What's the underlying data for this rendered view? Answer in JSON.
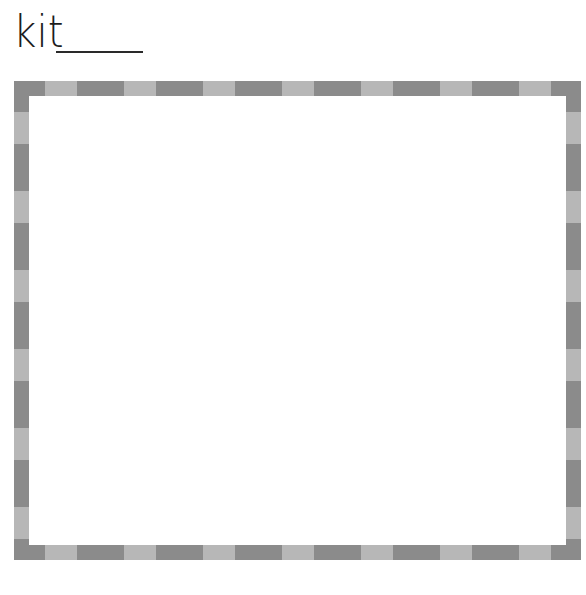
{
  "worksheet": {
    "word": "kit",
    "answer_blank": "",
    "drawing_box": {
      "border_style": "dashed-two-tone",
      "colors": {
        "dark": "#8b8b8b",
        "light": "#b7b7b7",
        "fill": "#ffffff"
      },
      "pattern": {
        "corner_length": 31,
        "dark_length": 47,
        "light_length": 32
      },
      "content": ""
    }
  }
}
